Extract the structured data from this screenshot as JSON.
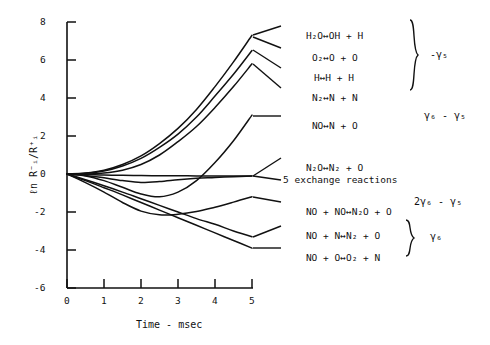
{
  "axes": {
    "y_label": "ℓn R⁻ᵢ/R⁺ᵢ",
    "x_label": "Time - msec",
    "x_ticks": [
      "0",
      "1",
      "2",
      "3",
      "4",
      "5"
    ],
    "y_ticks": [
      "8",
      "6",
      "4",
      "2",
      "0",
      "-2",
      "-4",
      "-6"
    ],
    "xlim": [
      0,
      5
    ],
    "ylim": [
      -6,
      8
    ]
  },
  "legend": {
    "groups": [
      {
        "brace_label": "-γ₅",
        "reactions": [
          {
            "lhs": "H₂O",
            "arrow": "↔",
            "rhs": "OH + H"
          },
          {
            "lhs": "O₂",
            "arrow": "↔",
            "rhs": "O + O"
          },
          {
            "lhs": "H",
            "arrow": "↔",
            "rhs": "H + H"
          },
          {
            "lhs": "N₂",
            "arrow": "↔",
            "rhs": "N + N"
          }
        ]
      },
      {
        "brace_label": "γ₆ - γ₅",
        "reactions": [
          {
            "lhs": "NO",
            "arrow": "↔",
            "rhs": "N + O"
          }
        ]
      },
      {
        "brace_label": "2γ₆ - γ₅",
        "reactions": [
          {
            "lhs": "N₂O",
            "arrow": "↔",
            "rhs": "N₂ + O"
          },
          {
            "lhs": "5 exchange reactions",
            "arrow": "",
            "rhs": ""
          },
          {
            "lhs": "NO + NO",
            "arrow": "↔",
            "rhs": "N₂O + O"
          }
        ]
      },
      {
        "brace_label": "γ₆",
        "reactions": [
          {
            "lhs": "NO + N",
            "arrow": "↔",
            "rhs": "N₂ + O"
          },
          {
            "lhs": "NO + O",
            "arrow": "↔",
            "rhs": "O₂ + N"
          }
        ]
      }
    ]
  },
  "chart_data": {
    "type": "line",
    "title": "",
    "xlabel": "Time - msec",
    "ylabel": "ℓn R⁻ᵢ/R⁺ᵢ",
    "xlim": [
      0,
      5
    ],
    "ylim": [
      -6,
      8
    ],
    "grid": false,
    "legend_position": "right-external",
    "x": [
      0,
      0.5,
      1,
      1.5,
      2,
      2.5,
      3,
      3.5,
      4,
      4.5,
      5
    ],
    "series": [
      {
        "name": "H₂O ↔ OH + H",
        "values": [
          0,
          0.05,
          0.2,
          0.5,
          0.95,
          1.6,
          2.4,
          3.4,
          4.6,
          5.9,
          7.3
        ]
      },
      {
        "name": "O₂ ↔ O + O",
        "values": [
          0,
          0.04,
          0.16,
          0.42,
          0.82,
          1.4,
          2.1,
          3.0,
          4.1,
          5.25,
          6.5
        ]
      },
      {
        "name": "H ↔ H + H",
        "values": [
          0,
          0.0,
          0.05,
          0.2,
          0.5,
          1.0,
          1.7,
          2.5,
          3.5,
          4.6,
          5.8
        ]
      },
      {
        "name": "N₂ ↔ N + N",
        "values": [
          0,
          -0.1,
          -0.35,
          -0.7,
          -1.05,
          -1.2,
          -0.95,
          -0.35,
          0.6,
          1.75,
          3.1
        ]
      },
      {
        "name": "NO ↔ N + O",
        "values": [
          0,
          -0.02,
          -0.05,
          -0.07,
          -0.08,
          -0.09,
          -0.09,
          -0.1,
          -0.1,
          -0.1,
          -0.1
        ]
      },
      {
        "name": "N₂O ↔ N₂ + O",
        "values": [
          0,
          -0.08,
          -0.2,
          -0.35,
          -0.45,
          -0.4,
          -0.3,
          -0.22,
          -0.18,
          -0.14,
          -0.1
        ]
      },
      {
        "name": "5 exchange reactions",
        "values": [
          0,
          -0.45,
          -0.95,
          -1.5,
          -1.95,
          -2.15,
          -2.12,
          -1.98,
          -1.75,
          -1.48,
          -1.2
        ]
      },
      {
        "name": "NO + NO ↔ N₂O + O",
        "values": [
          0,
          -0.3,
          -0.62,
          -0.95,
          -1.3,
          -1.65,
          -2.0,
          -2.35,
          -2.65,
          -3.0,
          -3.3
        ]
      },
      {
        "name": "NO + N ↔ N₂ + O",
        "values": [
          0,
          -0.35,
          -0.72,
          -1.1,
          -1.5,
          -1.9,
          -2.3,
          -2.7,
          -3.1,
          -3.5,
          -3.9
        ]
      }
    ]
  }
}
